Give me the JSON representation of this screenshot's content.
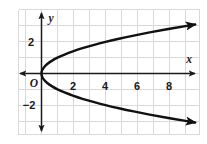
{
  "figure": {
    "background_color": "#ffffff",
    "grid_color": "#d8d8d8",
    "axis_color": "#1a1a1a",
    "curve_color": "#111111",
    "origin_label": "O",
    "x_axis_label": "x",
    "y_axis_label": "y"
  },
  "chart_data": {
    "type": "line",
    "title": "",
    "xlabel": "x",
    "ylabel": "y",
    "grid": true,
    "legend": "none",
    "xlim": [
      -1.5,
      10
    ],
    "ylim": [
      -4.2,
      4.5
    ],
    "xticks": [
      2,
      4,
      6,
      8
    ],
    "xtick_labels": [
      "2",
      "4",
      "6",
      "8"
    ],
    "yticks": [
      2,
      -2
    ],
    "ytick_labels": [
      "2",
      "−2"
    ],
    "grid_spacing": 1,
    "annotations": [
      "O"
    ],
    "series": [
      {
        "name": "x = y²",
        "equation": "x = y^2",
        "description": "Rightward-opening parabola with vertex at the origin",
        "vertex": [
          0,
          0
        ],
        "opens": "right",
        "arrowheads": "both-ends",
        "points": [
          [
            9.6,
            -3.1
          ],
          [
            9.0,
            -3.0
          ],
          [
            7.84,
            -2.8
          ],
          [
            6.76,
            -2.6
          ],
          [
            5.76,
            -2.4
          ],
          [
            4.84,
            -2.2
          ],
          [
            4.0,
            -2.0
          ],
          [
            3.24,
            -1.8
          ],
          [
            2.56,
            -1.6
          ],
          [
            1.96,
            -1.4
          ],
          [
            1.44,
            -1.2
          ],
          [
            1.0,
            -1.0
          ],
          [
            0.64,
            -0.8
          ],
          [
            0.36,
            -0.6
          ],
          [
            0.16,
            -0.4
          ],
          [
            0.04,
            -0.2
          ],
          [
            0.0,
            0.0
          ],
          [
            0.04,
            0.2
          ],
          [
            0.16,
            0.4
          ],
          [
            0.36,
            0.6
          ],
          [
            0.64,
            0.8
          ],
          [
            1.0,
            1.0
          ],
          [
            1.44,
            1.2
          ],
          [
            1.96,
            1.4
          ],
          [
            2.56,
            1.6
          ],
          [
            3.24,
            1.8
          ],
          [
            4.0,
            2.0
          ],
          [
            4.84,
            2.2
          ],
          [
            5.76,
            2.4
          ],
          [
            6.76,
            2.6
          ],
          [
            7.84,
            2.8
          ],
          [
            9.0,
            3.0
          ],
          [
            9.6,
            3.1
          ]
        ]
      }
    ]
  }
}
